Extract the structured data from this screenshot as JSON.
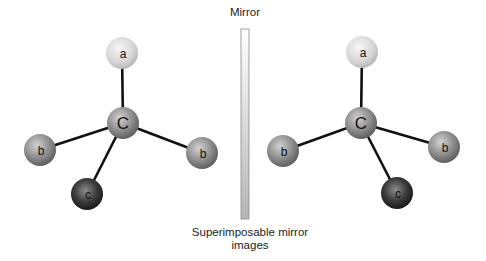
{
  "mirror": {
    "label": "Mirror",
    "x": 241,
    "y": 29,
    "width": 8,
    "height": 190,
    "gradient_top": "#ffffff",
    "gradient_bottom": "#b5b5b5",
    "stroke": "#8a8a8a"
  },
  "caption": {
    "line1": "Superimposable mirror",
    "line2": "images"
  },
  "colors": {
    "bond": "#111111",
    "atom_a_light": "#f4f4f4",
    "atom_a_dark": "#bdbdbd",
    "atom_mid_light": "#d0d0d0",
    "atom_mid_dark": "#6b6b6b",
    "atom_c_light": "#8a8a8a",
    "atom_c_dark": "#1a1a1a"
  },
  "molecules": [
    {
      "name": "left",
      "center": {
        "label": "C",
        "x": 123,
        "y": 123
      },
      "atoms": [
        {
          "label": "a",
          "x": 122,
          "y": 53,
          "shade": "light"
        },
        {
          "label": "b",
          "x": 40,
          "y": 150,
          "shade": "mid"
        },
        {
          "label": "b",
          "x": 202,
          "y": 153,
          "shade": "mid"
        },
        {
          "label": "c",
          "x": 87,
          "y": 194,
          "shade": "dark"
        }
      ]
    },
    {
      "name": "right",
      "center": {
        "label": "C",
        "x": 361,
        "y": 123
      },
      "atoms": [
        {
          "label": "a",
          "x": 362,
          "y": 52,
          "shade": "light"
        },
        {
          "label": "b",
          "x": 283,
          "y": 151,
          "shade": "mid"
        },
        {
          "label": "b",
          "x": 444,
          "y": 147,
          "shade": "mid"
        },
        {
          "label": "c",
          "x": 397,
          "y": 193,
          "shade": "dark"
        }
      ]
    }
  ]
}
